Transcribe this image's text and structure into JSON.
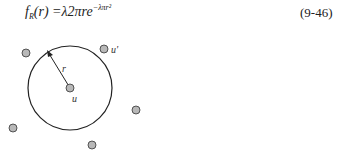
{
  "equation": {
    "lhs_f": "f",
    "lhs_sub": "R",
    "lhs_arg": "(r)",
    "rhs": "=λ2πre",
    "exponent": "−λπr²",
    "number": "(9-46)"
  },
  "figure": {
    "center_label": "u",
    "neighbor_label": "u'",
    "radius_label": "r",
    "circle": {
      "cx": 70,
      "cy": 88,
      "r": 42
    },
    "node_color": "#b8b8b8",
    "node_stroke": "#333333",
    "nodes": [
      {
        "x": 26,
        "y": 53
      },
      {
        "x": 104,
        "y": 49
      },
      {
        "x": 70,
        "y": 88
      },
      {
        "x": 136,
        "y": 110
      },
      {
        "x": 13,
        "y": 128
      },
      {
        "x": 92,
        "y": 145
      }
    ]
  }
}
